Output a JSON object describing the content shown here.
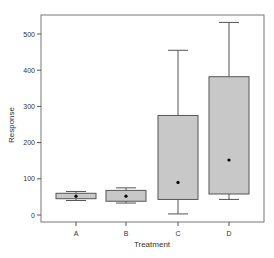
{
  "chart_data": {
    "type": "box",
    "title": "",
    "xlabel": "Treatment",
    "ylabel": "Response",
    "ylim": [
      -20,
      555
    ],
    "yticks": [
      0,
      100,
      200,
      300,
      400,
      500
    ],
    "categories": [
      "A",
      "B",
      "C",
      "D"
    ],
    "boxes": [
      {
        "name": "A",
        "whisker_low": 40,
        "q1": 45,
        "median": 52,
        "q3": 60,
        "whisker_high": 65,
        "mean": 52
      },
      {
        "name": "B",
        "whisker_low": 33,
        "q1": 38,
        "median": 52,
        "q3": 68,
        "whisker_high": 75,
        "mean": 52
      },
      {
        "name": "C",
        "whisker_low": 3,
        "q1": 43,
        "median": 90,
        "q3": 275,
        "whisker_high": 455,
        "mean": 90
      },
      {
        "name": "D",
        "whisker_low": 43,
        "q1": 58,
        "median": 152,
        "q3": 382,
        "whisker_high": 532,
        "mean": 152
      }
    ],
    "box_fill": "#c8c8c8",
    "box_stroke": "#555555",
    "grid": false,
    "legend": null
  }
}
